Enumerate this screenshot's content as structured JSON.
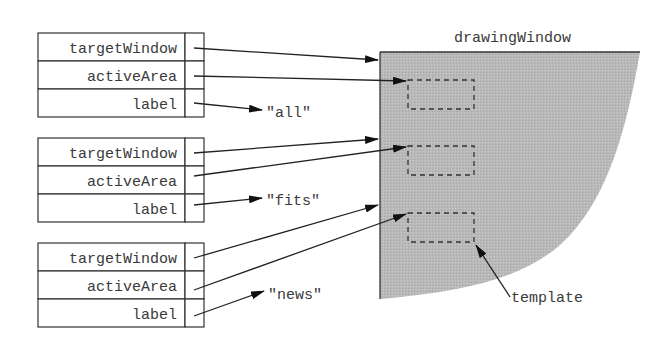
{
  "diagram": {
    "window_label": "drawingWindow",
    "template_label": "template",
    "colors": {
      "window_fill": "#b8b8b8",
      "line": "#222222",
      "text": "#3a3a3a"
    },
    "records": [
      {
        "fields": [
          "targetWindow",
          "activeArea",
          "label"
        ],
        "label_value": "\"all\""
      },
      {
        "fields": [
          "targetWindow",
          "activeArea",
          "label"
        ],
        "label_value": "\"fits\""
      },
      {
        "fields": [
          "targetWindow",
          "activeArea",
          "label"
        ],
        "label_value": "\"news\""
      }
    ]
  }
}
